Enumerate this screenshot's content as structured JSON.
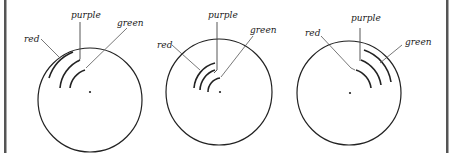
{
  "diagram": {
    "panels": [
      {
        "id": "panel-1",
        "circle": {
          "cx": 90,
          "cy": 100,
          "r": 52
        },
        "labels": {
          "red": "red",
          "purple": "purple",
          "green": "green"
        },
        "arc_position": "upper-left, large"
      },
      {
        "id": "panel-2",
        "circle": {
          "cx": 219,
          "cy": 92,
          "r": 53
        },
        "labels": {
          "red": "red",
          "purple": "purple",
          "green": "green"
        },
        "arc_position": "upper-left, small near center"
      },
      {
        "id": "panel-3",
        "circle": {
          "cx": 349,
          "cy": 93,
          "r": 52
        },
        "labels": {
          "red": "red",
          "purple": "purple",
          "green": "green"
        },
        "arc_position": "upper-right"
      }
    ],
    "colors": {
      "stroke": "#222222",
      "leader": "#555555",
      "border": "#555555",
      "background": "#ffffff"
    }
  }
}
